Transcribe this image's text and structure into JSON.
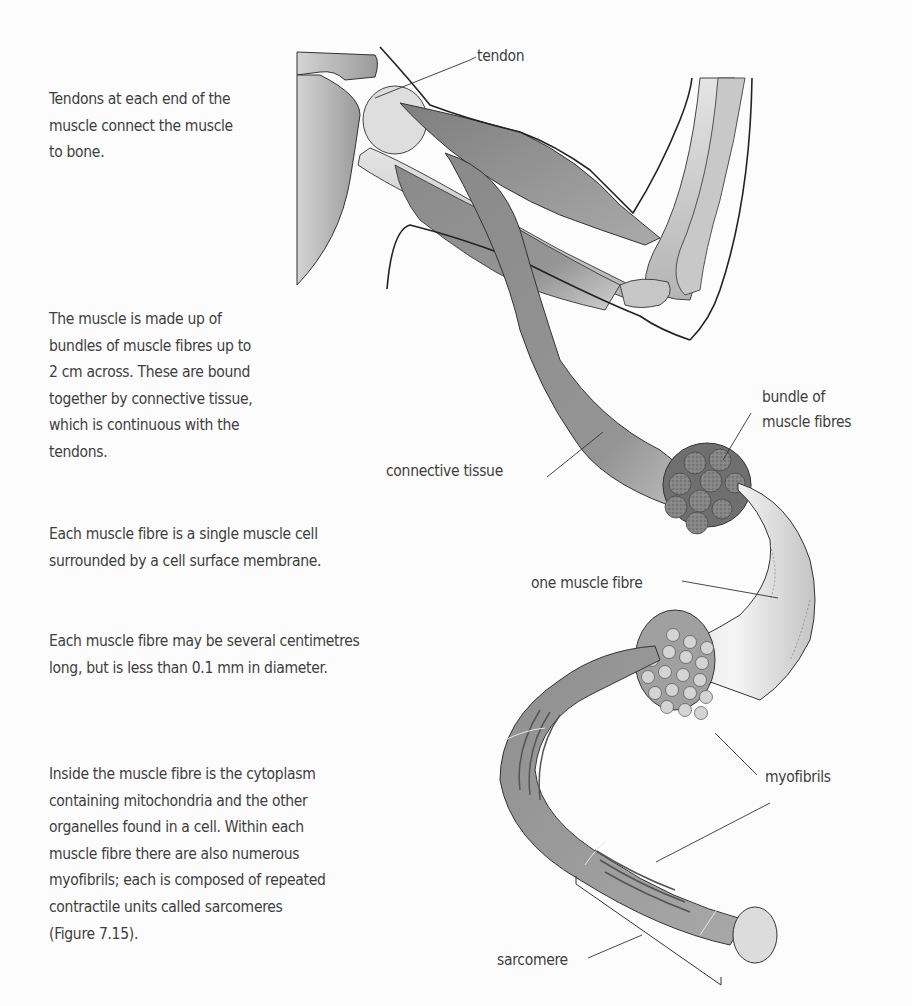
{
  "figure": {
    "labels": {
      "tendon": "tendon",
      "bundle_of_muscle_fibres": [
        "bundle of",
        "muscle fibres"
      ],
      "connective_tissue": "connective tissue",
      "one_muscle_fibre": "one muscle fibre",
      "myofibrils": "myofibrils",
      "sarcomere": "sarcomere"
    },
    "colors": {
      "background": "#fcfcfc",
      "muscle_dark": "#7a7a7a",
      "muscle_mid": "#9a9a9a",
      "bone_light": "#d8d8d8",
      "outline": "#2a2a2a",
      "text": "#3e3e3e"
    }
  },
  "annotations": [
    {
      "id": "tendons",
      "lines": [
        "Tendons at each end of the",
        "muscle connect the muscle",
        "to bone."
      ]
    },
    {
      "id": "bundles",
      "lines": [
        "The muscle is made up of",
        "bundles of muscle fibres up to",
        "2 cm across. These are bound",
        "together by connective tissue,",
        "which is continuous with the",
        "tendons."
      ]
    },
    {
      "id": "single-cell",
      "lines": [
        "Each muscle fibre is a single muscle cell",
        "surrounded by a cell surface membrane."
      ]
    },
    {
      "id": "fibre-size",
      "lines": [
        "Each muscle fibre may be several centimetres",
        "long, but is less than 0.1 mm in diameter."
      ]
    },
    {
      "id": "cytoplasm",
      "lines": [
        "Inside the muscle fibre is the cytoplasm",
        "containing mitochondria and the other",
        "organelles found in a cell. Within each",
        "muscle fibre there are also numerous",
        "myofibrils; each is composed of repeated",
        "contractile units called sarcomeres",
        "(Figure 7.15)."
      ]
    }
  ]
}
